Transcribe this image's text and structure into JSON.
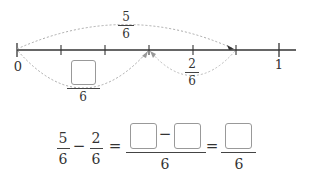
{
  "number_line": {
    "start_label": "0",
    "end_label": "1",
    "divisions": 6,
    "tick_count": 7,
    "line_color": "#333333",
    "arc_color": "#aaaaaa"
  },
  "arcs": {
    "top": {
      "from": "0",
      "to": "5/6",
      "numerator": "5",
      "denominator": "6"
    },
    "bottom_right": {
      "from": "5/6",
      "to": "3/6",
      "numerator": "2",
      "denominator": "6"
    },
    "bottom_left": {
      "from": "0",
      "to": "3/6",
      "numerator_box": "",
      "denominator": "6"
    }
  },
  "equation": {
    "term1": {
      "numerator": "5",
      "denominator": "6"
    },
    "operator1": "−",
    "term2": {
      "numerator": "2",
      "denominator": "6"
    },
    "equals1": "=",
    "middle": {
      "box1": "",
      "operator": "−",
      "box2": "",
      "denominator": "6"
    },
    "equals2": "=",
    "result": {
      "box": "",
      "denominator": "6"
    }
  }
}
